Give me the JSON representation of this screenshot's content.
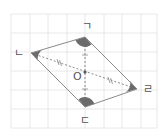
{
  "figure": {
    "type": "parallelogram-diagram",
    "grid": {
      "x0": 11,
      "y0": 14,
      "x1": 157,
      "y1": 128,
      "spacing": 18.4,
      "color": "#e2e2e2"
    },
    "vertices": [
      {
        "id": "giyeok",
        "label": "ㄱ",
        "x": 85,
        "y": 37,
        "label_x": 82,
        "label_y": 30
      },
      {
        "id": "nieun",
        "label": "ㄴ",
        "x": 31,
        "y": 53,
        "label_x": 14,
        "label_y": 57
      },
      {
        "id": "digeut",
        "label": "ㄷ",
        "x": 85,
        "y": 107,
        "label_x": 80,
        "label_y": 124
      },
      {
        "id": "rieul",
        "label": "ㄹ",
        "x": 137,
        "y": 89,
        "label_x": 143,
        "label_y": 93
      }
    ],
    "center": {
      "label": "O",
      "x": 85,
      "y": 72,
      "label_x": 73,
      "label_y": 80
    },
    "colors": {
      "edge": "#8a8a8a",
      "angle_fill": "#6b6b6b",
      "diagonal": "#8a8a8a",
      "label": "#555555"
    },
    "diagonals": [
      {
        "from": "nieun",
        "to": "rieul",
        "style": "dashed",
        "tick_marks": "double"
      },
      {
        "from": "giyeok",
        "to": "digeut",
        "style": "dashed",
        "tick_marks": "single"
      }
    ]
  }
}
